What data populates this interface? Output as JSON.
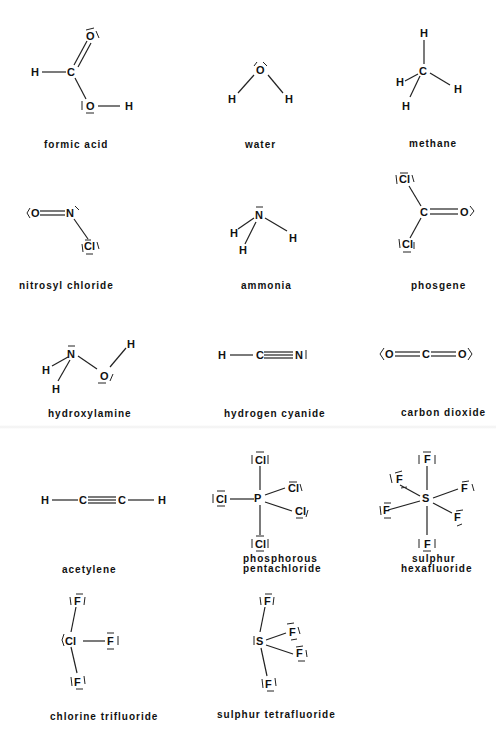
{
  "figure": {
    "molecules": [
      {
        "name": "formic acid",
        "atoms": [
          "H",
          "C",
          "O",
          "O",
          "H"
        ]
      },
      {
        "name": "water",
        "atoms": [
          "O",
          "H",
          "H"
        ]
      },
      {
        "name": "methane",
        "atoms": [
          "H",
          "C",
          "H",
          "H",
          "H"
        ]
      },
      {
        "name": "nitrosyl chloride",
        "atoms": [
          "O",
          "N",
          "Cl"
        ]
      },
      {
        "name": "ammonia",
        "atoms": [
          "N",
          "H",
          "H",
          "H"
        ]
      },
      {
        "name": "phosgene",
        "atoms": [
          "Cl",
          "C",
          "O",
          "Cl"
        ]
      },
      {
        "name": "hydroxylamine",
        "atoms": [
          "N",
          "H",
          "H",
          "O",
          "H"
        ]
      },
      {
        "name": "hydrogen cyanide",
        "atoms": [
          "H",
          "C",
          "N"
        ]
      },
      {
        "name": "carbon dioxide",
        "atoms": [
          "O",
          "C",
          "O"
        ]
      },
      {
        "name": "acetylene",
        "atoms": [
          "H",
          "C",
          "C",
          "H"
        ]
      },
      {
        "name": "phosphorous pentachloride",
        "name_lines": [
          "phosphorous",
          "pentachloride"
        ],
        "atoms": [
          "P",
          "Cl",
          "Cl",
          "Cl",
          "Cl",
          "Cl"
        ]
      },
      {
        "name": "sulphur hexafluoride",
        "name_lines": [
          "sulphur",
          "hexafluoride"
        ],
        "atoms": [
          "S",
          "F",
          "F",
          "F",
          "F",
          "F",
          "F"
        ]
      },
      {
        "name": "chlorine trifluoride",
        "atoms": [
          "Cl",
          "F",
          "F",
          "F"
        ]
      },
      {
        "name": "sulphur tetrafluoride",
        "atoms": [
          "S",
          "F",
          "F",
          "F",
          "F"
        ]
      }
    ]
  },
  "labels": {
    "formic_acid": "formic acid",
    "water": "water",
    "methane": "methane",
    "nitrosyl_chloride": "nitrosyl chloride",
    "ammonia": "ammonia",
    "phosgene": "phosgene",
    "hydroxylamine": "hydroxylamine",
    "hydrogen_cyanide": "hydrogen cyanide",
    "carbon_dioxide": "carbon dioxide",
    "acetylene": "acetylene",
    "pcl5_line1": "phosphorous",
    "pcl5_line2": "pentachloride",
    "sf6_line1": "sulphur",
    "sf6_line2": "hexafluoride",
    "chlorine_trifluoride": "chlorine trifluoride",
    "sulphur_tetrafluoride": "sulphur tetrafluoride"
  },
  "symbols": {
    "H": "H",
    "C": "C",
    "O": "O",
    "N": "N",
    "Cl": "Cl",
    "P": "P",
    "S": "S",
    "F": "F"
  }
}
